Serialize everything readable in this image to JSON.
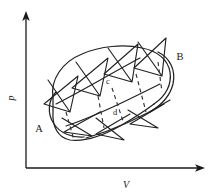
{
  "figure": {
    "type": "pv-diagram",
    "title": "",
    "background_color": "#ffffff",
    "line_color": "#222222",
    "axes": {
      "y_label": "p",
      "x_label": "V",
      "y_axis_name": "pressure-axis",
      "x_axis_name": "volume-axis",
      "origin": {
        "x": 26,
        "y": 168
      },
      "y_top": {
        "x": 26,
        "y": 14
      },
      "x_right": {
        "x": 205,
        "y": 168
      },
      "arrowheads": [
        "up",
        "right"
      ]
    },
    "point_labels": [
      {
        "id": "A",
        "text": "A",
        "x": 39,
        "y": 132,
        "size": "big"
      },
      {
        "id": "B",
        "text": "B",
        "x": 180,
        "y": 60,
        "size": "big"
      },
      {
        "id": "c",
        "text": "c",
        "x": 108,
        "y": 84,
        "size": "small"
      },
      {
        "id": "d",
        "text": "d",
        "x": 115,
        "y": 115,
        "size": "small"
      }
    ],
    "envelope": {
      "description": "tilted oval envelope enclosing the helical path",
      "center": {
        "x": 110,
        "y": 100
      },
      "semi_major": 62,
      "semi_minor": 33,
      "rotation_deg": -24
    },
    "helix": {
      "description": "helical (spiral) path drawn as repeating bow-tie / zigzag loops ascending from A to B",
      "turns": 4,
      "dashed_segments": 4,
      "dash_pattern": "4 3.5"
    }
  }
}
